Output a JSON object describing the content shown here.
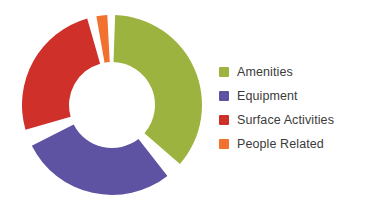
{
  "chart_data": {
    "type": "pie",
    "variant": "donut",
    "title": "",
    "subtitle": "",
    "xlabel": "",
    "ylabel": "",
    "grid": false,
    "legend_position": "right",
    "center": {
      "x": 98,
      "y": 98
    },
    "outer_radius": 90,
    "inner_radius": 43,
    "gap_degrees": 9,
    "start_angle_degrees": 2,
    "categories": [
      "Amenities",
      "Equipment",
      "Surface Activities",
      "People Related"
    ],
    "values": [
      36,
      28,
      25,
      2
    ],
    "value_unit": "percent",
    "colors": [
      "#9DB340",
      "#5D53A2",
      "#D0302A",
      "#F2712F"
    ],
    "slices": [
      {
        "label": "Amenities",
        "value": 36,
        "color": "#9DB340",
        "start_angle": 2,
        "end_angle": 131
      },
      {
        "label": "Equipment",
        "value": 28,
        "color": "#5D53A2",
        "start_angle": 142,
        "end_angle": 243
      },
      {
        "label": "Surface Activities",
        "value": 25,
        "color": "#D0302A",
        "start_angle": 254,
        "end_angle": 344
      },
      {
        "label": "People Related",
        "value": 2,
        "color": "#F2712F",
        "start_angle": 350,
        "end_angle": 357
      }
    ]
  },
  "legend": {
    "items": [
      {
        "label": "Amenities",
        "color": "#9DB340",
        "swatch_name": "legend-swatch-amenities"
      },
      {
        "label": "Equipment",
        "color": "#5D53A2",
        "swatch_name": "legend-swatch-equipment"
      },
      {
        "label": "Surface Activities",
        "color": "#D0302A",
        "swatch_name": "legend-swatch-surface-activities"
      },
      {
        "label": "People Related",
        "color": "#F2712F",
        "swatch_name": "legend-swatch-people-related"
      }
    ]
  },
  "theme": {
    "background": "#ffffff",
    "text_color": "#3b3b3b"
  }
}
